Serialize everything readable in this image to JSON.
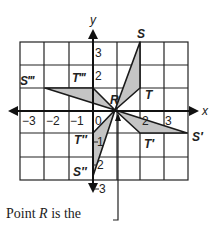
{
  "figure": {
    "axis_labels": {
      "x": "x",
      "y": "y"
    },
    "x_ticks": [
      {
        "value": -3,
        "label": "−3"
      },
      {
        "value": -2,
        "label": "−2"
      },
      {
        "value": -1,
        "label": "−1"
      },
      {
        "value": 0,
        "label": "0"
      },
      {
        "value": 2,
        "label": "2"
      },
      {
        "value": 3,
        "label": "3"
      }
    ],
    "y_ticks": [
      {
        "value": 3,
        "label": "3"
      },
      {
        "value": 2,
        "label": "2"
      },
      {
        "value": -1,
        "label": "1"
      },
      {
        "value": -2,
        "label": "2"
      },
      {
        "value": -3,
        "label": "3"
      }
    ],
    "grid": {
      "x_min": -3,
      "x_max": 4,
      "y_min": -3,
      "y_max": 3
    },
    "points": {
      "R": {
        "label": "R",
        "x": 1,
        "y": 0
      },
      "S": {
        "label": "S",
        "x": 2,
        "y": 3
      },
      "T": {
        "label": "T",
        "x": 2,
        "y": 1
      },
      "S1": {
        "label": "S′",
        "x": 4,
        "y": -1
      },
      "T1": {
        "label": "T′",
        "x": 2,
        "y": -1
      },
      "S2": {
        "label": "S″",
        "x": 0,
        "y": -3
      },
      "T2": {
        "label": "T″",
        "x": 0,
        "y": -1
      },
      "S3": {
        "label": "S‴",
        "x": -2,
        "y": 1
      },
      "T3": {
        "label": "T‴",
        "x": 0,
        "y": 1
      }
    },
    "triangles": [
      {
        "name": "RST",
        "vertices": [
          "R",
          "S",
          "T"
        ]
      },
      {
        "name": "RS'T'",
        "vertices": [
          "R",
          "S1",
          "T1"
        ]
      },
      {
        "name": "RS''T''",
        "vertices": [
          "R",
          "S2",
          "T2"
        ]
      },
      {
        "name": "RS'''T'''",
        "vertices": [
          "R",
          "S3",
          "T3"
        ]
      }
    ],
    "colors": {
      "fill": "#c4c4c4",
      "stroke": "#1a1a1a",
      "grid": "#222222"
    }
  },
  "caption": {
    "prefix": "Point ",
    "variable": "R",
    "suffix": " is the"
  }
}
